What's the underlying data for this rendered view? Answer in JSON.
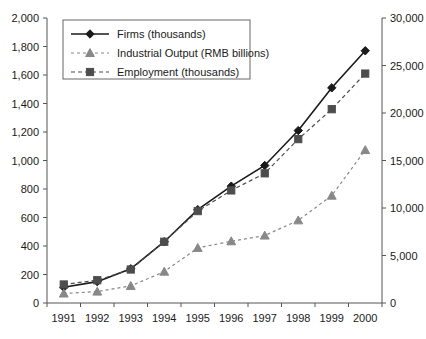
{
  "chart_data": {
    "type": "line",
    "title": "",
    "subtitle": "",
    "xlabel": "",
    "ylabel": "",
    "grid": false,
    "legend_position": "top-left",
    "categories": [
      "1991",
      "1992",
      "1993",
      "1994",
      "1995",
      "1996",
      "1997",
      "1998",
      "1999",
      "2000"
    ],
    "axes": {
      "left": {
        "label": "",
        "min": 0,
        "max": 2000,
        "step": 200,
        "ticks": [
          "0",
          "200",
          "400",
          "600",
          "800",
          "1,000",
          "1,200",
          "1,400",
          "1,600",
          "1,800",
          "2,000"
        ]
      },
      "right": {
        "label": "",
        "min": 0,
        "max": 30000,
        "step": 5000,
        "ticks": [
          "0",
          "5,000",
          "10,000",
          "15,000",
          "20,000",
          "25,000",
          "30,000"
        ]
      },
      "x": {
        "ticks": [
          "1991",
          "1992",
          "1993",
          "1994",
          "1995",
          "1996",
          "1997",
          "1998",
          "1999",
          "2000"
        ]
      }
    },
    "series": [
      {
        "name": "Firms (thousands)",
        "axis": "left",
        "marker": "diamond",
        "line_style": "solid",
        "color": "#1a1a1a",
        "values": [
          110,
          150,
          240,
          430,
          655,
          820,
          965,
          1210,
          1510,
          1770
        ]
      },
      {
        "name": "Industrial Output (RMB billions)",
        "axis": "right",
        "marker": "triangle",
        "line_style": "dashed",
        "color": "#888888",
        "values": [
          1000,
          1200,
          1800,
          3300,
          5800,
          6500,
          7100,
          8700,
          11300,
          16100
        ]
      },
      {
        "name": "Employment (thousands)",
        "axis": "left",
        "marker": "square",
        "line_style": "dashed",
        "color": "#4d4d4d",
        "values": [
          130,
          160,
          235,
          430,
          645,
          790,
          910,
          1150,
          1360,
          1610
        ]
      }
    ],
    "legend": [
      {
        "label": "Firms (thousands)",
        "marker": "diamond",
        "line_style": "solid",
        "color": "#1a1a1a"
      },
      {
        "label": "Industrial Output (RMB billions)",
        "marker": "triangle",
        "line_style": "dashed",
        "color": "#888888"
      },
      {
        "label": "Employment (thousands)",
        "marker": "square",
        "line_style": "dashed",
        "color": "#4d4d4d"
      }
    ]
  }
}
